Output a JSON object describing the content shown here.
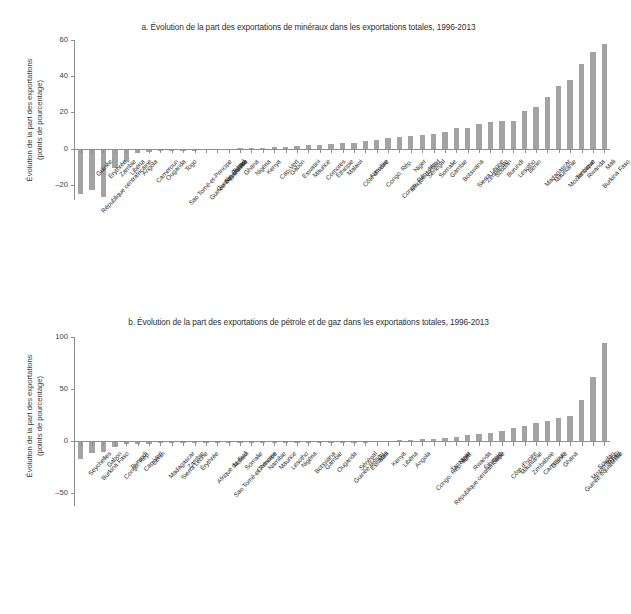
{
  "figure": {
    "ylabel_line1": "Évolution de la part des exportations",
    "ylabel_line2": "(points de pourcentage)"
  },
  "chart_data": [
    {
      "type": "bar",
      "panel": "a",
      "title": "a. Évolution de la part des exportations de minéraux dans les exportations totales, 1996-2013",
      "xlabel": "",
      "ylabel": "Évolution de la part des exportations (points de pourcentage)",
      "ylim": [
        -28,
        60
      ],
      "yticks": [
        60,
        40,
        20,
        0,
        -20
      ],
      "grid": false,
      "legend": "none",
      "bar_color": "#a3a3a3",
      "categories": [
        "République centrafricaine",
        "Guinée",
        "Érythrée",
        "Zambie",
        "Libéria",
        "Angola",
        "Cameroun",
        "Ouganda",
        "Sao Tomé-et-Principe",
        "Togo",
        "Guinée équatoriale",
        "Guinée Bissau",
        "Seychelles",
        "Tchad",
        "Ghana",
        "Nigéria",
        "Kenya",
        "Cap-Vert",
        "Gabon",
        "Eswatini",
        "Maurice",
        "Comores",
        "Éthiopie",
        "Malawi",
        "Côte d'Ivoire",
        "Namibie",
        "Congo, Rép.",
        "Congo, Rép. dém.",
        "Afrique du Sud",
        "Niger",
        "Sénégal",
        "Somalie",
        "Gambie",
        "Botswana",
        "Sierra Leone",
        "Zimbabwe",
        "Soudan",
        "Burundi",
        "Lesotho",
        "Bénin",
        "Madagascar",
        "Mauritanie",
        "Mozambique",
        "Tanzanie",
        "Rwanda",
        "Burkina Faso",
        "Mali"
      ],
      "values": [
        -24.5,
        -22.5,
        -26.5,
        -10.5,
        -7.0,
        -2.0,
        -1.5,
        -1.2,
        -1.0,
        -0.9,
        -0.8,
        -0.7,
        -0.6,
        -0.5,
        0.4,
        0.6,
        0.8,
        1.0,
        1.3,
        1.6,
        2.0,
        2.4,
        2.8,
        3.2,
        3.6,
        4.2,
        5.0,
        6.0,
        6.6,
        7.2,
        7.8,
        8.2,
        9.5,
        11.5,
        11.6,
        13.8,
        14.8,
        15.2,
        15.4,
        21.2,
        23.4,
        28.6,
        34.5,
        38.0,
        47.0,
        53.5,
        58.0
      ]
    },
    {
      "type": "bar",
      "panel": "b",
      "title": "b. Évolution de la part des exportations de pétrole et de gaz dans les exportations totales, 1996-2013",
      "xlabel": "",
      "ylabel": "Évolution de la part des exportations (points de pourcentage)",
      "ylim": [
        -62,
        100
      ],
      "yticks": [
        100,
        50,
        0,
        -50
      ],
      "grid": false,
      "legend": "none",
      "bar_color": "#a3a3a3",
      "categories": [
        "Seychelles",
        "Burkina Faso",
        "Gabon",
        "Congo, Rép.",
        "Burundi",
        "Cap-Vert",
        "Bénin",
        "Madagascar",
        "Sierra Leone",
        "Zambie",
        "Érythrée",
        "Afrique du Sud",
        "Sao Tomé-et-Principe",
        "Malawi",
        "Somalie",
        "Comores",
        "Namibie",
        "Maurice",
        "Lesotho",
        "Nigéria",
        "Botswana",
        "Gambie",
        "Ouganda",
        "Guinée Bissau",
        "Sénégal",
        "Eswatini",
        "Mali",
        "Kenya",
        "Libéria",
        "Angola",
        "Congo, Rép. dém.",
        "République centrafricaine",
        "Tanzanie",
        "Niger",
        "Rwanda",
        "Éthiopie",
        "Togo",
        "Côte d'Ivoire",
        "Mauritanie",
        "Zimbabwe",
        "Cameroun",
        "Guinée",
        "Ghana",
        "Guinée équatoriale",
        "Mozambique",
        "Soudan",
        "Tchad"
      ],
      "values": [
        -17.0,
        -11.0,
        -10.5,
        -5.0,
        -3.0,
        -2.6,
        -2.2,
        -2.0,
        -1.8,
        -1.6,
        -1.4,
        -1.2,
        -1.1,
        -1.0,
        -0.9,
        -0.8,
        -0.7,
        -0.6,
        -0.5,
        -0.4,
        -0.3,
        -0.25,
        -0.2,
        -0.15,
        -0.1,
        -0.05,
        0.3,
        0.6,
        1.0,
        1.5,
        2.0,
        2.6,
        3.4,
        4.2,
        5.6,
        6.6,
        8.0,
        9.6,
        13.0,
        14.6,
        17.5,
        19.5,
        22.0,
        24.0,
        40.0,
        62.0,
        94.0
      ]
    }
  ]
}
